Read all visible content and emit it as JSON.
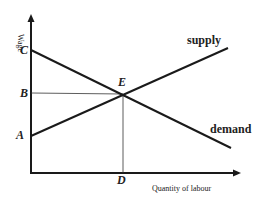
{
  "diagram": {
    "axes": {
      "y_label": "Wage",
      "x_label": "Quantity of labour"
    },
    "points": {
      "C": "C",
      "B": "B",
      "A": "A",
      "E": "E",
      "D": "D"
    },
    "curves": {
      "supply": "supply",
      "demand": "demand"
    },
    "colors": {
      "line": "#1a1a1a",
      "background": "#ffffff"
    }
  }
}
